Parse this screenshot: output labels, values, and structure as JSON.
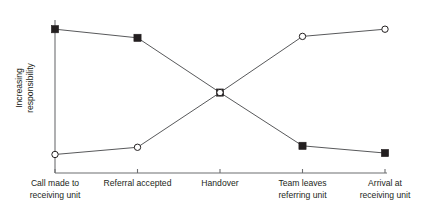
{
  "chart_data": {
    "type": "line",
    "title": "",
    "subtitle": "",
    "xlabel": "",
    "ylabel": "Increasing responsibility",
    "ylabel_lines": [
      "Increasing",
      "responsibility"
    ],
    "categories": [
      "Call made to receiving unit",
      "Referral accepted",
      "Handover",
      "Team leaves referring unit",
      "Arrival at receiving unit"
    ],
    "category_lines": [
      [
        "Call made to",
        "receiving unit"
      ],
      [
        "Referral accepted"
      ],
      [
        "Handover"
      ],
      [
        "Team leaves",
        "referring unit"
      ],
      [
        "Arrival at",
        "receiving unit"
      ]
    ],
    "ylim": [
      0,
      100
    ],
    "yticks": [],
    "grid": false,
    "legend": false,
    "legend_position": "none",
    "axis_color": "#6d6e71",
    "line_color": "#58595b",
    "marker_color": "#231f20",
    "series": [
      {
        "name": "Referring unit responsibility",
        "marker": "filled-square",
        "values": [
          95,
          89,
          51,
          14,
          9
        ]
      },
      {
        "name": "Receiving unit responsibility",
        "marker": "open-circle",
        "values": [
          8,
          13,
          51,
          90,
          95
        ]
      }
    ]
  }
}
